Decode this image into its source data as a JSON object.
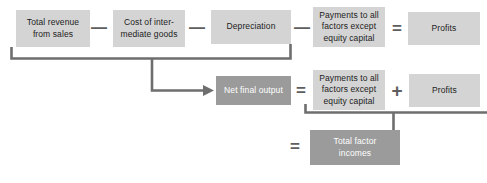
{
  "diagram": {
    "colors": {
      "box_light": "#d4d4d4",
      "box_dark": "#9b9b9b",
      "connector": "#6e6e6e",
      "text_dark": "#1c1c1c",
      "text_light": "#ffffff",
      "background": "#ffffff"
    },
    "rows": [
      {
        "id": "row-revenue-identity",
        "items": [
          {
            "kind": "box",
            "style": "light",
            "label": "Total revenue\nfrom sales"
          },
          {
            "kind": "operator",
            "label": "—",
            "name": "minus"
          },
          {
            "kind": "box",
            "style": "light",
            "label": "Cost of inter-\nmediate goods"
          },
          {
            "kind": "operator",
            "label": "—",
            "name": "minus"
          },
          {
            "kind": "box",
            "style": "light",
            "label": "Depreciation"
          },
          {
            "kind": "operator",
            "label": "—",
            "name": "minus"
          },
          {
            "kind": "box",
            "style": "light",
            "label": "Payments to all\nfactors except\nequity capital"
          },
          {
            "kind": "operator",
            "label": "=",
            "name": "equals"
          },
          {
            "kind": "box",
            "style": "light",
            "label": "Profits"
          }
        ]
      },
      {
        "id": "row-net-final-output",
        "items": [
          {
            "kind": "box",
            "style": "dark",
            "label": "Net final output"
          },
          {
            "kind": "operator",
            "label": "=",
            "name": "equals"
          },
          {
            "kind": "box",
            "style": "light",
            "label": "Payments to all\nfactors except\nequity capital"
          },
          {
            "kind": "operator",
            "label": "+",
            "name": "plus"
          },
          {
            "kind": "box",
            "style": "light",
            "label": "Profits"
          }
        ]
      },
      {
        "id": "row-total-factor-incomes",
        "items": [
          {
            "kind": "operator",
            "label": "=",
            "name": "equals"
          },
          {
            "kind": "box",
            "style": "dark",
            "label": "Total factor\nincomes"
          }
        ]
      }
    ],
    "labels": {
      "total_revenue": "Total revenue\nfrom sales",
      "cost_intermediate": "Cost of inter-\nmediate goods",
      "depreciation": "Depreciation",
      "payments_top": "Payments to all\nfactors except\nequity capital",
      "profits_top": "Profits",
      "net_final_output": "Net final output",
      "payments_mid": "Payments to all\nfactors except\nequity capital",
      "profits_mid": "Profits",
      "total_factor_incomes": "Total factor\nincomes",
      "minus_1": "—",
      "minus_2": "—",
      "minus_3": "—",
      "equals_top": "=",
      "equals_mid": "=",
      "equals_bottom": "=",
      "plus_mid": "+"
    }
  }
}
